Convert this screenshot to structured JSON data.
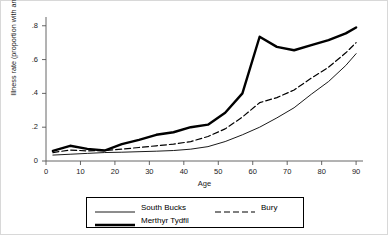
{
  "chart_data": {
    "type": "line",
    "title": "",
    "xlabel": "Age",
    "ylabel": "Illness rate (proportion with an illness)",
    "xlim": [
      0,
      92
    ],
    "ylim": [
      0,
      0.84
    ],
    "grid": false,
    "legend_position": "bottom-center",
    "xticks": [
      0,
      10,
      20,
      30,
      40,
      50,
      60,
      70,
      80,
      90
    ],
    "xtick_labels": [
      "0",
      "10",
      "20",
      "30",
      "40",
      "50",
      "60",
      "70",
      "80",
      "90"
    ],
    "yticks": [
      0,
      0.2,
      0.4,
      0.6,
      0.8
    ],
    "ytick_labels": [
      "0",
      ".2",
      ".4",
      ".6",
      ".8"
    ],
    "x": [
      2,
      7,
      12,
      17,
      22,
      27,
      32,
      37,
      42,
      47,
      52,
      57,
      62,
      67,
      72,
      77,
      82,
      87,
      90
    ],
    "series": [
      {
        "name": "South Bucks",
        "style": "solid-thin",
        "color": "#000000",
        "width": 0.9,
        "values": [
          0.035,
          0.04,
          0.045,
          0.05,
          0.052,
          0.055,
          0.058,
          0.062,
          0.07,
          0.085,
          0.115,
          0.155,
          0.2,
          0.255,
          0.315,
          0.395,
          0.47,
          0.565,
          0.635
        ]
      },
      {
        "name": "Bury",
        "style": "dashed",
        "color": "#000000",
        "width": 1.2,
        "values": [
          0.05,
          0.065,
          0.06,
          0.062,
          0.07,
          0.08,
          0.09,
          0.1,
          0.115,
          0.145,
          0.19,
          0.26,
          0.345,
          0.375,
          0.42,
          0.49,
          0.555,
          0.64,
          0.7
        ]
      },
      {
        "name": "Merthyr Tydfil",
        "style": "solid-thick",
        "color": "#000000",
        "width": 2.4,
        "values": [
          0.06,
          0.09,
          0.072,
          0.062,
          0.1,
          0.125,
          0.155,
          0.17,
          0.2,
          0.215,
          0.285,
          0.4,
          0.735,
          0.675,
          0.655,
          0.685,
          0.715,
          0.755,
          0.79
        ]
      }
    ]
  },
  "legend": {
    "entries": [
      {
        "label": "South Bucks",
        "style": "solid-thin"
      },
      {
        "label": "Bury",
        "style": "dashed"
      },
      {
        "label": "Merthyr Tydfil",
        "style": "solid-thick"
      }
    ]
  },
  "colors": {
    "line": "#000000",
    "axis": "#555555",
    "frame": "#d8d8d8",
    "background": "#ffffff"
  }
}
